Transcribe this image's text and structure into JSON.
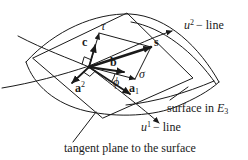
{
  "diagram": {
    "coordinate_lines": {
      "u2": {
        "base": "u",
        "sup": "2",
        "rest": "− line"
      },
      "u1": {
        "base": "u",
        "sup": "1",
        "rest": "− line"
      }
    },
    "annotations": {
      "surface_prefix": "surface in",
      "surface_symbol": "E",
      "surface_sub": "3",
      "tangent_plane": "tangent plane to the surface"
    },
    "vectors": {
      "c": "c",
      "tau": "τ",
      "s": "s",
      "b": "b",
      "sigma": "σ",
      "phi": "ϕ",
      "a1_base": "a",
      "a1_sub": "1",
      "a2_base": "a",
      "a2_sup": "2"
    },
    "colors": {
      "ink": "#1a1a1a",
      "background": "#ffffff"
    }
  }
}
